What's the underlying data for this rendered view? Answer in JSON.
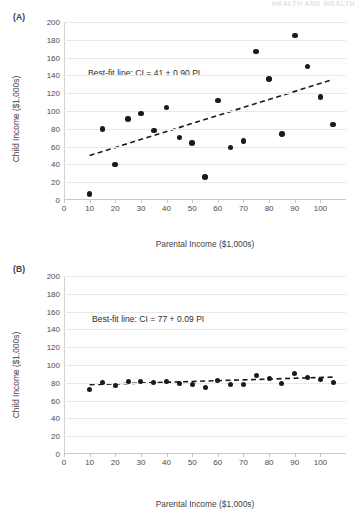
{
  "running_header": "HEALTH AND WEALTH",
  "panels": [
    {
      "id": "A",
      "label": "(A)",
      "annotation": "Best-fit line: CI = 41 + 0.90 PI",
      "chart_key": 0
    },
    {
      "id": "B",
      "label": "(B)",
      "annotation": "Best-fit line: CI = 77 + 0.09 PI",
      "chart_key": 1
    }
  ],
  "chart_data": [
    {
      "type": "scatter",
      "title": "(A)",
      "xlabel": "Parental Income ($1,000s)",
      "ylabel": "Child Income ($1,000s)",
      "xlim": [
        0,
        110
      ],
      "ylim": [
        0,
        200
      ],
      "xticks": [
        0,
        10,
        20,
        30,
        40,
        50,
        60,
        70,
        80,
        90,
        100
      ],
      "yticks": [
        0,
        20,
        40,
        60,
        80,
        100,
        120,
        140,
        160,
        180,
        200
      ],
      "grid": true,
      "legend": "none",
      "annotation": "Best-fit line: CI = 41 + 0.90 PI",
      "fit_line": {
        "intercept": 41,
        "slope": 0.9,
        "style": "dashed",
        "x_start": 10,
        "x_end": 105
      },
      "points": [
        {
          "x": 10,
          "y": 7
        },
        {
          "x": 15,
          "y": 80
        },
        {
          "x": 20,
          "y": 40
        },
        {
          "x": 25,
          "y": 91
        },
        {
          "x": 30,
          "y": 97
        },
        {
          "x": 35,
          "y": 78
        },
        {
          "x": 40,
          "y": 104
        },
        {
          "x": 45,
          "y": 70
        },
        {
          "x": 50,
          "y": 64
        },
        {
          "x": 55,
          "y": 26
        },
        {
          "x": 60,
          "y": 112
        },
        {
          "x": 65,
          "y": 59
        },
        {
          "x": 70,
          "y": 66
        },
        {
          "x": 75,
          "y": 167
        },
        {
          "x": 80,
          "y": 136
        },
        {
          "x": 85,
          "y": 74
        },
        {
          "x": 90,
          "y": 185
        },
        {
          "x": 95,
          "y": 150
        },
        {
          "x": 100,
          "y": 116
        },
        {
          "x": 105,
          "y": 85
        }
      ]
    },
    {
      "type": "scatter",
      "title": "(B)",
      "xlabel": "Parental Income ($1,000s)",
      "ylabel": "Child Income ($1,000s)",
      "xlim": [
        0,
        110
      ],
      "ylim": [
        0,
        200
      ],
      "xticks": [
        0,
        10,
        20,
        30,
        40,
        50,
        60,
        70,
        80,
        90,
        100
      ],
      "yticks": [
        0,
        20,
        40,
        60,
        80,
        100,
        120,
        140,
        160,
        180,
        200
      ],
      "grid": true,
      "legend": "none",
      "annotation": "Best-fit line: CI = 77 + 0.09 PI",
      "fit_line": {
        "intercept": 77,
        "slope": 0.09,
        "style": "dashed",
        "x_start": 10,
        "x_end": 105
      },
      "points": [
        {
          "x": 10,
          "y": 73
        },
        {
          "x": 15,
          "y": 80
        },
        {
          "x": 20,
          "y": 76.5
        },
        {
          "x": 25,
          "y": 81
        },
        {
          "x": 30,
          "y": 81.5
        },
        {
          "x": 35,
          "y": 80
        },
        {
          "x": 40,
          "y": 81.5
        },
        {
          "x": 45,
          "y": 79.5
        },
        {
          "x": 50,
          "y": 78.5
        },
        {
          "x": 55,
          "y": 75
        },
        {
          "x": 60,
          "y": 83
        },
        {
          "x": 65,
          "y": 78
        },
        {
          "x": 70,
          "y": 78.5
        },
        {
          "x": 75,
          "y": 88.5
        },
        {
          "x": 80,
          "y": 85
        },
        {
          "x": 85,
          "y": 79
        },
        {
          "x": 90,
          "y": 90
        },
        {
          "x": 95,
          "y": 86.5
        },
        {
          "x": 100,
          "y": 83.5
        },
        {
          "x": 105,
          "y": 80
        }
      ]
    }
  ]
}
